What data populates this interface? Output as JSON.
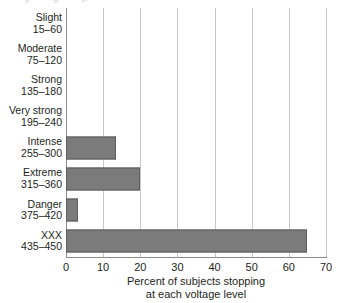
{
  "chart_data": {
    "type": "bar",
    "orientation": "horizontal",
    "title": "",
    "subtitle": "",
    "xlabel": "Percent of subjects stopping at each voltage level",
    "xlabel_lines": [
      "Percent of subjects stopping",
      "at each voltage level"
    ],
    "ylabel": "",
    "categories": [
      "Slight 15–60",
      "Moderate 75–120",
      "Strong 135–180",
      "Very strong 195–240",
      "Intense 255–300",
      "Extreme 315–360",
      "Danger 375–420",
      "XXX 435–450"
    ],
    "category_rows": [
      {
        "name": "Slight",
        "range": "15–60",
        "value": 0
      },
      {
        "name": "Moderate",
        "range": "75–120",
        "value": 0
      },
      {
        "name": "Strong",
        "range": "135–180",
        "value": 0
      },
      {
        "name": "Very strong",
        "range": "195–240",
        "value": 0
      },
      {
        "name": "Intense",
        "range": "255–300",
        "value": 13.5
      },
      {
        "name": "Extreme",
        "range": "315–360",
        "value": 20
      },
      {
        "name": "Danger",
        "range": "375–420",
        "value": 3.3
      },
      {
        "name": "XXX",
        "range": "435–450",
        "value": 65
      }
    ],
    "values": [
      0,
      0,
      0,
      0,
      13.5,
      20,
      3.3,
      65
    ],
    "xlim": [
      0,
      70
    ],
    "xticks": [
      0,
      10,
      20,
      30,
      40,
      50,
      60,
      70
    ],
    "xtick_labels": [
      "0",
      "10",
      "20",
      "30",
      "40",
      "50",
      "60",
      "70"
    ],
    "grid": "vertical",
    "legend": "none",
    "bar_color": "#7b7b7b",
    "bar_edge_color": "#5d5d5d",
    "gridline_color": "#c9c9c9",
    "axis_color": "#8c8c8c",
    "text_color": "#231f20"
  }
}
